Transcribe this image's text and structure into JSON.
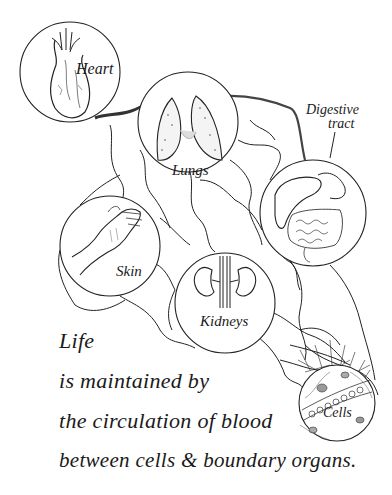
{
  "organs": {
    "heart": {
      "label": "Heart"
    },
    "lungs": {
      "label": "Lungs"
    },
    "digestive": {
      "label_line1": "Digestive",
      "label_line2": "tract"
    },
    "skin": {
      "label": "Skin"
    },
    "kidneys": {
      "label": "Kidneys"
    },
    "cells": {
      "label": "Cells"
    }
  },
  "caption": {
    "line1": "Life",
    "line2": "is maintained by",
    "line3": "the circulation of blood",
    "line4": "between cells & boundary organs."
  },
  "colors": {
    "ink": "#1a1a1a",
    "background": "#ffffff"
  }
}
